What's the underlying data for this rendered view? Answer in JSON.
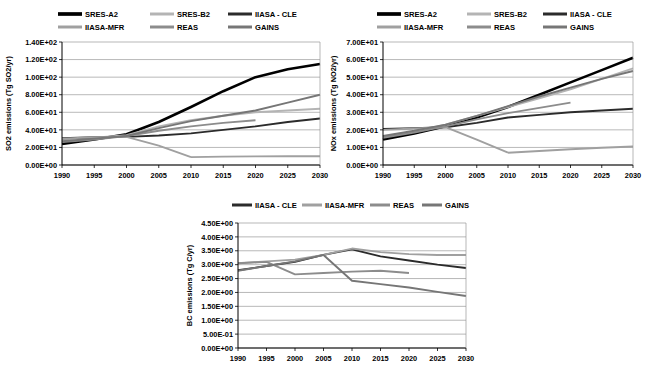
{
  "figure": {
    "colors": {
      "SRES-A2": "#000000",
      "SRES-B2": "#b4b4b4",
      "IIASA - CLE": "#2b2b2b",
      "IIASA-MFR": "#a0a0a0",
      "REAS": "#8c8c8c",
      "GAINS": "#767676"
    }
  },
  "chart_data": [
    {
      "id": "so2",
      "type": "line",
      "title": "",
      "xlabel": "",
      "ylabel": "SO2 emissions (Tg SO2/yr)",
      "x": [
        1990,
        1995,
        2000,
        2005,
        2010,
        2015,
        2020,
        2025,
        2030
      ],
      "xlim": [
        1990,
        2030
      ],
      "ylim": [
        0,
        140
      ],
      "yticks": [
        0,
        20,
        40,
        60,
        80,
        100,
        120,
        140
      ],
      "ytick_labels": [
        "0.00E+00",
        "2.00E+01",
        "4.00E+01",
        "6.00E+01",
        "8.00E+01",
        "1.00E+02",
        "1.20E+02",
        "1.40E+02"
      ],
      "xtick_labels": [
        "1990",
        "1995",
        "2000",
        "2005",
        "2010",
        "2015",
        "2020",
        "2025",
        "2030"
      ],
      "grid": true,
      "legend": [
        "SRES-A2",
        "SRES-B2",
        "IIASA - CLE",
        "IIASA-MFR",
        "REAS",
        "GAINS"
      ],
      "legend_position": "top",
      "series": [
        {
          "name": "SRES-A2",
          "x": [
            1990,
            1995,
            2000,
            2005,
            2010,
            2015,
            2020,
            2025,
            2030
          ],
          "values": [
            24.0,
            29.0,
            35.0,
            49.0,
            66.0,
            84.0,
            100.0,
            109.0,
            115.0
          ]
        },
        {
          "name": "SRES-B2",
          "x": [
            1990,
            1995,
            2000,
            2005,
            2010,
            2015,
            2020,
            2025,
            2030
          ],
          "values": [
            29.0,
            31.0,
            34.0,
            44.0,
            51.0,
            56.0,
            60.0,
            62.0,
            64.0
          ]
        },
        {
          "name": "IIASA - CLE",
          "x": [
            1990,
            1995,
            2000,
            2005,
            2010,
            2015,
            2020,
            2025,
            2030
          ],
          "values": [
            30.5,
            31.5,
            32.0,
            33.5,
            36.0,
            40.0,
            44.0,
            49.0,
            53.0
          ]
        },
        {
          "name": "IIASA-MFR",
          "x": [
            1990,
            1995,
            2000,
            2005,
            2010
          ],
          "values": [
            30.0,
            31.5,
            32.0,
            22.0,
            9.0
          ]
        },
        {
          "name": "REAS",
          "x": [
            1990,
            1995,
            2000,
            2005,
            2010,
            2015,
            2020
          ],
          "values": [
            26.0,
            29.0,
            33.0,
            39.0,
            44.0,
            48.0,
            51.0
          ]
        },
        {
          "name": "GAINS",
          "x": [
            1990,
            1995,
            2000,
            2005,
            2010,
            2015,
            2020,
            2025,
            2030
          ],
          "values": [
            27.0,
            30.0,
            33.0,
            42.0,
            50.0,
            56.0,
            62.0,
            71.0,
            80.0
          ]
        },
        {
          "name": "IIASA-MFR-flat",
          "x": [
            2010,
            2015,
            2020,
            2025,
            2030
          ],
          "values": [
            9.0,
            9.5,
            9.8,
            10.0,
            10.0
          ]
        }
      ]
    },
    {
      "id": "nox",
      "type": "line",
      "title": "",
      "xlabel": "",
      "ylabel": "NOx emissions (Tg NO2/yr)",
      "x": [
        1990,
        1995,
        2000,
        2005,
        2010,
        2015,
        2020,
        2025,
        2030
      ],
      "xlim": [
        1990,
        2030
      ],
      "ylim": [
        0,
        70
      ],
      "yticks": [
        0,
        10,
        20,
        30,
        40,
        50,
        60,
        70
      ],
      "ytick_labels": [
        "0.00E+00",
        "1.00E+01",
        "2.00E+01",
        "3.00E+01",
        "4.00E+01",
        "5.00E+01",
        "6.00E+01",
        "7.00E+01"
      ],
      "xtick_labels": [
        "1990",
        "1995",
        "2000",
        "2005",
        "2010",
        "2015",
        "2020",
        "2025",
        "2030"
      ],
      "grid": true,
      "legend": [
        "SRES-A2",
        "SRES-B2",
        "IIASA - CLE",
        "IIASA-MFR",
        "REAS",
        "GAINS"
      ],
      "legend_position": "top",
      "series": [
        {
          "name": "SRES-A2",
          "x": [
            1990,
            1995,
            2000,
            2005,
            2010,
            2015,
            2020,
            2025,
            2030
          ],
          "values": [
            14.5,
            18.0,
            22.0,
            27.0,
            33.0,
            40.0,
            47.0,
            54.0,
            61.0
          ]
        },
        {
          "name": "SRES-B2",
          "x": [
            1990,
            1995,
            2000,
            2005,
            2010,
            2015,
            2020,
            2025,
            2030
          ],
          "values": [
            16.0,
            19.0,
            23.0,
            28.0,
            33.0,
            38.0,
            43.0,
            49.0,
            55.0
          ]
        },
        {
          "name": "IIASA - CLE",
          "x": [
            1990,
            1995,
            2000,
            2005,
            2010,
            2015,
            2020,
            2025,
            2030
          ],
          "values": [
            20.5,
            21.0,
            21.5,
            24.0,
            27.0,
            28.5,
            30.0,
            31.0,
            32.0
          ]
        },
        {
          "name": "IIASA-MFR",
          "x": [
            1990,
            1995,
            2000,
            2005,
            2010
          ],
          "values": [
            20.0,
            20.8,
            21.5,
            14.5,
            7.0
          ]
        },
        {
          "name": "REAS",
          "x": [
            1990,
            1995,
            2000,
            2005,
            2010,
            2015,
            2020
          ],
          "values": [
            15.5,
            18.5,
            22.0,
            26.0,
            29.5,
            32.5,
            35.5
          ]
        },
        {
          "name": "GAINS",
          "x": [
            1990,
            1995,
            2000,
            2005,
            2010,
            2015,
            2020,
            2025,
            2030
          ],
          "values": [
            16.5,
            19.5,
            23.0,
            28.0,
            33.5,
            39.0,
            44.0,
            49.0,
            53.5
          ]
        },
        {
          "name": "IIASA-MFR-flat",
          "x": [
            2010,
            2015,
            2020,
            2025,
            2030
          ],
          "values": [
            7.0,
            8.0,
            9.0,
            9.8,
            10.5
          ]
        }
      ]
    },
    {
      "id": "bc",
      "type": "line",
      "title": "",
      "xlabel": "",
      "ylabel": "BC emissions (Tg C/yr)",
      "x": [
        1990,
        1995,
        2000,
        2005,
        2010,
        2015,
        2020,
        2025,
        2030
      ],
      "xlim": [
        1990,
        2030
      ],
      "ylim": [
        0,
        4.5
      ],
      "yticks": [
        0,
        0.5,
        1.0,
        1.5,
        2.0,
        2.5,
        3.0,
        3.5,
        4.0,
        4.5
      ],
      "ytick_labels": [
        "0.00E+00",
        "5.00E-01",
        "1.00E+00",
        "1.50E+00",
        "2.00E+00",
        "2.50E+00",
        "3.00E+00",
        "3.50E+00",
        "4.00E+00",
        "4.50E+00"
      ],
      "xtick_labels": [
        "1990",
        "1995",
        "2000",
        "2005",
        "2010",
        "2015",
        "2020",
        "2025",
        "2030"
      ],
      "grid": true,
      "legend": [
        "IIASA - CLE",
        "IIASA-MFR",
        "REAS",
        "GAINS"
      ],
      "legend_position": "top",
      "series": [
        {
          "name": "IIASA - CLE",
          "x": [
            1990,
            1995,
            2000,
            2005,
            2010,
            2015,
            2020,
            2025,
            2030
          ],
          "values": [
            2.8,
            2.95,
            3.1,
            3.35,
            3.55,
            3.3,
            3.15,
            3.0,
            2.88
          ]
        },
        {
          "name": "IIASA-MFR",
          "x": [
            1990,
            1995,
            2000,
            2005,
            2010,
            2015,
            2020,
            2025,
            2030
          ],
          "values": [
            3.05,
            3.12,
            3.18,
            3.35,
            3.58,
            3.45,
            3.38,
            3.35,
            3.35
          ]
        },
        {
          "name": "REAS",
          "x": [
            1990,
            1995,
            2000,
            2005,
            2010,
            2015,
            2020
          ],
          "values": [
            3.05,
            3.1,
            2.65,
            2.7,
            2.75,
            2.78,
            2.7
          ]
        },
        {
          "name": "GAINS",
          "x": [
            1990,
            1995,
            2000,
            2005,
            2010,
            2015,
            2020,
            2025,
            2030
          ],
          "values": [
            2.78,
            2.95,
            3.12,
            3.35,
            2.42,
            2.3,
            2.18,
            2.02,
            1.87
          ]
        }
      ]
    }
  ]
}
